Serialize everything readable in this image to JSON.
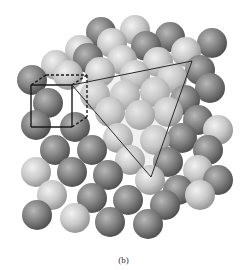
{
  "figure": {
    "caption": "(b)",
    "colors": {
      "light_sphere": "#d6d6d6",
      "dark_sphere": "#8a8a8a",
      "outline": "#1a1a1a",
      "background": "#ffffff"
    },
    "unit_cube": {
      "front": [
        [
          31,
          85
        ],
        [
          72,
          85
        ],
        [
          72,
          127
        ],
        [
          31,
          127
        ]
      ],
      "back": [
        [
          46,
          75
        ],
        [
          87,
          75
        ],
        [
          87,
          117
        ],
        [
          46,
          117
        ]
      ]
    },
    "triangle_plane": [
      [
        72,
        85
      ],
      [
        192,
        61
      ],
      [
        151,
        177
      ]
    ],
    "spheres": [
      {
        "x": 101,
        "y": 32,
        "r": 15,
        "t": "d"
      },
      {
        "x": 135,
        "y": 30,
        "r": 15,
        "t": "l"
      },
      {
        "x": 170,
        "y": 37,
        "r": 15,
        "t": "d"
      },
      {
        "x": 212,
        "y": 43,
        "r": 15,
        "t": "d"
      },
      {
        "x": 80,
        "y": 50,
        "r": 15,
        "t": "l"
      },
      {
        "x": 112,
        "y": 43,
        "r": 15,
        "t": "l"
      },
      {
        "x": 146,
        "y": 46,
        "r": 15,
        "t": "d"
      },
      {
        "x": 186,
        "y": 52,
        "r": 15,
        "t": "l"
      },
      {
        "x": 56,
        "y": 65,
        "r": 15,
        "t": "l"
      },
      {
        "x": 88,
        "y": 58,
        "r": 15,
        "t": "d"
      },
      {
        "x": 122,
        "y": 60,
        "r": 15,
        "t": "l"
      },
      {
        "x": 158,
        "y": 62,
        "r": 15,
        "t": "l"
      },
      {
        "x": 200,
        "y": 70,
        "r": 15,
        "t": "d"
      },
      {
        "x": 32,
        "y": 80,
        "r": 15,
        "t": "d"
      },
      {
        "x": 68,
        "y": 75,
        "r": 15,
        "t": "l"
      },
      {
        "x": 100,
        "y": 72,
        "r": 15,
        "t": "l"
      },
      {
        "x": 135,
        "y": 75,
        "r": 15,
        "t": "l"
      },
      {
        "x": 172,
        "y": 78,
        "r": 15,
        "t": "l"
      },
      {
        "x": 210,
        "y": 88,
        "r": 15,
        "t": "d"
      },
      {
        "x": 95,
        "y": 95,
        "r": 15,
        "t": "l"
      },
      {
        "x": 125,
        "y": 95,
        "r": 15,
        "t": "l"
      },
      {
        "x": 155,
        "y": 92,
        "r": 15,
        "t": "l"
      },
      {
        "x": 185,
        "y": 100,
        "r": 15,
        "t": "d"
      },
      {
        "x": 48,
        "y": 103,
        "r": 15,
        "t": "d"
      },
      {
        "x": 110,
        "y": 112,
        "r": 15,
        "t": "l"
      },
      {
        "x": 140,
        "y": 115,
        "r": 15,
        "t": "l"
      },
      {
        "x": 168,
        "y": 112,
        "r": 15,
        "t": "l"
      },
      {
        "x": 198,
        "y": 120,
        "r": 15,
        "t": "d"
      },
      {
        "x": 218,
        "y": 130,
        "r": 15,
        "t": "l"
      },
      {
        "x": 36,
        "y": 125,
        "r": 15,
        "t": "d"
      },
      {
        "x": 75,
        "y": 127,
        "r": 15,
        "t": "d"
      },
      {
        "x": 118,
        "y": 138,
        "r": 15,
        "t": "l"
      },
      {
        "x": 155,
        "y": 140,
        "r": 15,
        "t": "l"
      },
      {
        "x": 182,
        "y": 138,
        "r": 15,
        "t": "d"
      },
      {
        "x": 208,
        "y": 150,
        "r": 15,
        "t": "d"
      },
      {
        "x": 55,
        "y": 150,
        "r": 15,
        "t": "d"
      },
      {
        "x": 92,
        "y": 150,
        "r": 15,
        "t": "d"
      },
      {
        "x": 130,
        "y": 160,
        "r": 15,
        "t": "l"
      },
      {
        "x": 168,
        "y": 162,
        "r": 15,
        "t": "d"
      },
      {
        "x": 198,
        "y": 170,
        "r": 15,
        "t": "l"
      },
      {
        "x": 218,
        "y": 180,
        "r": 15,
        "t": "d"
      },
      {
        "x": 36,
        "y": 172,
        "r": 15,
        "t": "l"
      },
      {
        "x": 72,
        "y": 172,
        "r": 15,
        "t": "d"
      },
      {
        "x": 108,
        "y": 175,
        "r": 15,
        "t": "d"
      },
      {
        "x": 150,
        "y": 180,
        "r": 15,
        "t": "l"
      },
      {
        "x": 178,
        "y": 190,
        "r": 15,
        "t": "d"
      },
      {
        "x": 200,
        "y": 195,
        "r": 15,
        "t": "l"
      },
      {
        "x": 52,
        "y": 195,
        "r": 15,
        "t": "l"
      },
      {
        "x": 92,
        "y": 198,
        "r": 15,
        "t": "d"
      },
      {
        "x": 128,
        "y": 200,
        "r": 15,
        "t": "d"
      },
      {
        "x": 165,
        "y": 205,
        "r": 15,
        "t": "d"
      },
      {
        "x": 37,
        "y": 215,
        "r": 15,
        "t": "d"
      },
      {
        "x": 75,
        "y": 218,
        "r": 15,
        "t": "l"
      },
      {
        "x": 110,
        "y": 222,
        "r": 15,
        "t": "d"
      },
      {
        "x": 148,
        "y": 224,
        "r": 15,
        "t": "d"
      }
    ]
  }
}
